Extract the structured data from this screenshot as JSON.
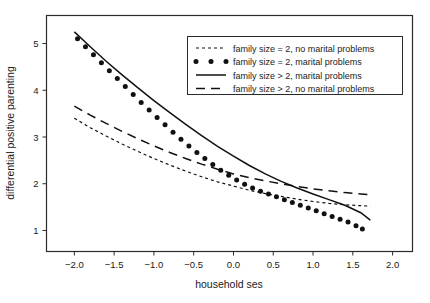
{
  "chart_data": {
    "type": "line",
    "title": "",
    "xlabel": "household ses",
    "ylabel": "differential positive parenting",
    "xlim": [
      -2.35,
      2.25
    ],
    "ylim": [
      0.55,
      5.6
    ],
    "xticks": [
      "-2.0",
      "-1.5",
      "-1.0",
      "-0.5",
      "0.0",
      "0.5",
      "1.0",
      "1.5",
      "2.0"
    ],
    "xtick_values": [
      -2.0,
      -1.5,
      -1.0,
      -0.5,
      0.0,
      0.5,
      1.0,
      1.5,
      2.0
    ],
    "yticks": [
      "1",
      "2",
      "3",
      "4",
      "5"
    ],
    "ytick_values": [
      1,
      2,
      3,
      4,
      5
    ],
    "grid": false,
    "legend_position": "top-right",
    "x": [
      -2.0,
      -1.8,
      -1.6,
      -1.4,
      -1.2,
      -1.0,
      -0.8,
      -0.6,
      -0.4,
      -0.2,
      0.0,
      0.2,
      0.4,
      0.6,
      0.8,
      1.0,
      1.2,
      1.4,
      1.6
    ],
    "series": [
      {
        "name": "family size = 2, no marital problems",
        "style": "short-dash",
        "x": [
          -2.0,
          -1.8,
          -1.6,
          -1.4,
          -1.2,
          -1.0,
          -0.8,
          -0.6,
          -0.4,
          -0.2,
          0.0,
          0.2,
          0.4,
          0.6,
          0.8,
          1.0,
          1.2,
          1.4,
          1.6,
          1.72
        ],
        "values": [
          3.4,
          3.2,
          3.02,
          2.85,
          2.69,
          2.54,
          2.4,
          2.27,
          2.15,
          2.04,
          1.95,
          1.86,
          1.79,
          1.73,
          1.67,
          1.62,
          1.58,
          1.55,
          1.53,
          1.52
        ]
      },
      {
        "name": "family size = 2, marital problems",
        "style": "dotted",
        "x": [
          -1.96,
          -1.86,
          -1.76,
          -1.66,
          -1.56,
          -1.46,
          -1.36,
          -1.26,
          -1.16,
          -1.06,
          -0.96,
          -0.86,
          -0.76,
          -0.66,
          -0.56,
          -0.46,
          -0.36,
          -0.26,
          -0.16,
          -0.06,
          0.04,
          0.14,
          0.24,
          0.34,
          0.44,
          0.54,
          0.64,
          0.74,
          0.84,
          0.94,
          1.04,
          1.14,
          1.24,
          1.34,
          1.44,
          1.54,
          1.62
        ],
        "values": [
          5.1,
          4.93,
          4.76,
          4.59,
          4.42,
          4.25,
          4.08,
          3.91,
          3.74,
          3.58,
          3.42,
          3.26,
          3.1,
          2.95,
          2.81,
          2.67,
          2.54,
          2.41,
          2.29,
          2.18,
          2.08,
          1.99,
          1.91,
          1.84,
          1.78,
          1.72,
          1.66,
          1.6,
          1.54,
          1.48,
          1.42,
          1.36,
          1.3,
          1.24,
          1.18,
          1.1,
          1.03
        ]
      },
      {
        "name": "family size > 2, marital problems",
        "style": "solid",
        "x": [
          -2.0,
          -1.8,
          -1.6,
          -1.4,
          -1.2,
          -1.0,
          -0.8,
          -0.6,
          -0.4,
          -0.2,
          0.0,
          0.2,
          0.4,
          0.6,
          0.8,
          1.0,
          1.2,
          1.4,
          1.6,
          1.72
        ],
        "values": [
          5.25,
          4.93,
          4.62,
          4.33,
          4.05,
          3.78,
          3.52,
          3.27,
          3.03,
          2.8,
          2.59,
          2.39,
          2.21,
          2.05,
          1.91,
          1.78,
          1.66,
          1.54,
          1.38,
          1.22
        ]
      },
      {
        "name": "family size > 2, no marital problems",
        "style": "long-dash",
        "x": [
          -2.0,
          -1.8,
          -1.6,
          -1.4,
          -1.2,
          -1.0,
          -0.8,
          -0.6,
          -0.4,
          -0.2,
          0.0,
          0.2,
          0.4,
          0.6,
          0.8,
          1.0,
          1.2,
          1.4,
          1.6,
          1.74
        ],
        "values": [
          3.66,
          3.47,
          3.29,
          3.12,
          2.96,
          2.81,
          2.67,
          2.54,
          2.42,
          2.31,
          2.21,
          2.13,
          2.06,
          2.0,
          1.94,
          1.89,
          1.85,
          1.81,
          1.78,
          1.76
        ]
      }
    ],
    "legend_entries": [
      {
        "label": "family size = 2, no marital problems",
        "style": "short-dash"
      },
      {
        "label": "family size = 2, marital problems",
        "style": "dotted"
      },
      {
        "label": "family size > 2, marital problems",
        "style": "solid"
      },
      {
        "label": "family size > 2, no marital problems",
        "style": "long-dash"
      }
    ]
  }
}
